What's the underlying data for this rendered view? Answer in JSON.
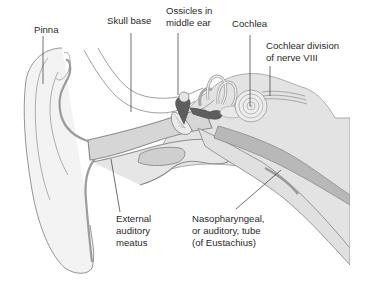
{
  "diagram": {
    "colors": {
      "background": "#ffffff",
      "tissue_light": "#efefef",
      "tissue_mid": "#d9d9d9",
      "tissue_dark": "#b5b5b5",
      "outline": "#8a8a8a",
      "bone_dark": "#5a5a5a",
      "leader_line": "#333333",
      "text": "#2a2a2a"
    },
    "labels": {
      "pinna": {
        "lines": [
          "Pinna"
        ]
      },
      "skull_base": {
        "lines": [
          "Skull base"
        ]
      },
      "ossicles": {
        "lines": [
          "Ossicles in",
          "middle ear"
        ]
      },
      "cochlea": {
        "lines": [
          "Cochlea"
        ]
      },
      "cochlear_nerve": {
        "lines": [
          "Cochlear division",
          "of nerve VIII"
        ]
      },
      "external_meatus": {
        "lines": [
          "External",
          "auditory",
          "meatus"
        ]
      },
      "eustachian_tube": {
        "lines": [
          "Nasopharyngeal,",
          "or auditory, tube",
          "(of Eustachius)"
        ]
      }
    }
  }
}
